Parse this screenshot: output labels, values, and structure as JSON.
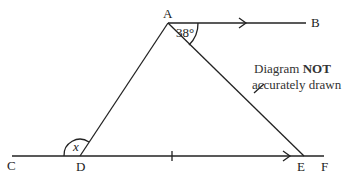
{
  "diagram": {
    "points": {
      "A": "A",
      "B": "B",
      "C": "C",
      "D": "D",
      "E": "E",
      "F": "F"
    },
    "angle_A": "38°",
    "angle_x": "x",
    "note_line1_prefix": "Diagram ",
    "note_line1_bold": "NOT",
    "note_line2": "accurately drawn"
  }
}
